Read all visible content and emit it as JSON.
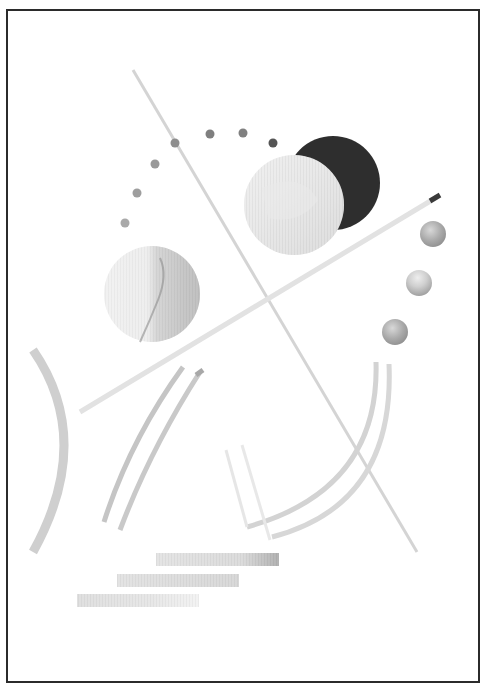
{
  "artwork": {
    "type": "abstract geometric print",
    "palette": {
      "background": "#ffffff",
      "frame": "#2b2b2b",
      "dark_circle": "#2e2e2e",
      "dots": [
        "#a9a9a9",
        "#9c9c9c",
        "#999999",
        "#8d8d8d",
        "#7f7f7f",
        "#808080",
        "#5a5a5a"
      ],
      "light_grey": "#d6d6d6",
      "mid_grey": "#b5b5b5"
    },
    "elements": {
      "dot_arc_count": 7,
      "small_marble_circles": 3,
      "large_circles": 3,
      "long_lines": 2,
      "arcs": 5,
      "bars": 3
    }
  }
}
